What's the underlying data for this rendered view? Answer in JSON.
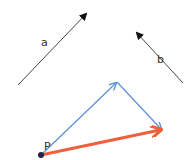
{
  "diagram": {
    "labels": {
      "a": "a",
      "b": "b",
      "point": "P"
    },
    "vectors": {
      "a": {
        "from": [
          18,
          85
        ],
        "to": [
          87,
          13
        ],
        "color": "#222222"
      },
      "b": {
        "from": [
          183,
          83
        ],
        "to": [
          136,
          32
        ],
        "color": "#222222"
      },
      "a_placed": {
        "from": [
          41,
          155
        ],
        "to": [
          117,
          82
        ],
        "color": "#5b8fd6"
      },
      "b_placed": {
        "from": [
          117,
          82
        ],
        "to": [
          162,
          130
        ],
        "color": "#5b8fd6"
      },
      "resultant": {
        "from": [
          41,
          155
        ],
        "to": [
          162,
          130
        ],
        "color": "#f0603c"
      }
    },
    "point_color": "#222244"
  }
}
